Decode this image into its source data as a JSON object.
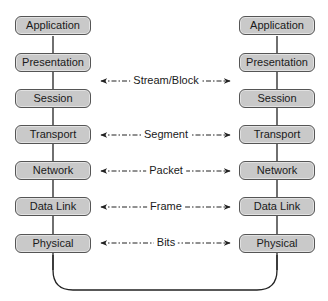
{
  "diagram": {
    "type": "osi-peer-communication",
    "left_stack": [
      "Application",
      "Presentation",
      "Session",
      "Transport",
      "Network",
      "Data Link",
      "Physical"
    ],
    "right_stack": [
      "Application",
      "Presentation",
      "Session",
      "Transport",
      "Network",
      "Data Link",
      "Physical"
    ],
    "pdu_arrows": [
      {
        "label": "Stream/Block",
        "between": "Presentation-Session"
      },
      {
        "label": "Segment",
        "layer": "Transport"
      },
      {
        "label": "Packet",
        "layer": "Network"
      },
      {
        "label": "Frame",
        "layer": "Data Link"
      },
      {
        "label": "Bits",
        "layer": "Physical"
      }
    ],
    "colors": {
      "box_fill": "#c9c9c9",
      "box_border": "#555555",
      "line": "#222222",
      "text": "#1a1a1a"
    }
  }
}
